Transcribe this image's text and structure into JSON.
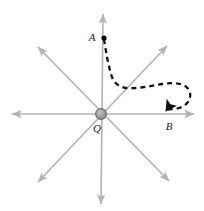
{
  "figure": {
    "type": "vector-field-diagram",
    "background_color": "#ffffff",
    "origin": {
      "label": "Q",
      "x": 101,
      "y": 114,
      "radius": 5.4,
      "fill_color": "#9a9a9a",
      "stroke_color": "#5a5a5a",
      "label_x": 97,
      "label_y": 129
    },
    "axes": {
      "color": "#b3b3b3",
      "stroke_width": 1.6,
      "arrow_size": 5.5,
      "lines": [
        {
          "name": "horizontal-axis",
          "x1": 12,
          "y1": 114,
          "x2": 194,
          "y2": 114,
          "arrow_start": true,
          "arrow_end": true
        },
        {
          "name": "vertical-axis",
          "x1": 103,
          "y1": 14,
          "x2": 101,
          "y2": 204,
          "arrow_start": true,
          "arrow_end": true
        },
        {
          "name": "diagonal-axis-ne-sw",
          "x1": 38,
          "y1": 182,
          "x2": 167,
          "y2": 46,
          "arrow_start": true,
          "arrow_end": true
        },
        {
          "name": "diagonal-axis-nw-se",
          "x1": 38,
          "y1": 47,
          "x2": 169,
          "y2": 181,
          "arrow_start": true,
          "arrow_end": true
        }
      ]
    },
    "points": [
      {
        "name": "point-a",
        "label": "A",
        "x": 104,
        "y": 38,
        "label_x": 92,
        "label_y": 38,
        "marker": "dot",
        "color": "#000000"
      },
      {
        "name": "point-b",
        "label": "B",
        "x": 168,
        "y": 113,
        "label_x": 169,
        "label_y": 127,
        "marker": "arrowhead",
        "color": "#000000"
      }
    ],
    "path": {
      "name": "dashed-trajectory",
      "from": "A",
      "to": "B",
      "color": "#111111",
      "stroke_width": 2.3,
      "dash_pattern": "5,4",
      "d": "M 104 39 C 106 52 108 64 111 74 C 113 82 118 87 126 88 C 138 89 150 86 162 84 C 174 82 185 83 189 90 C 193 98 187 106 179 108 C 173 110 168 108 166 111"
    }
  }
}
